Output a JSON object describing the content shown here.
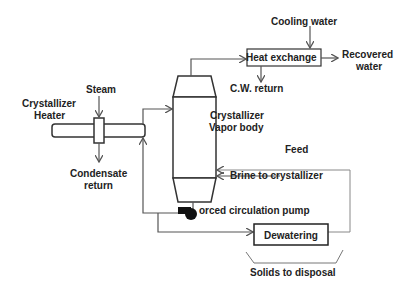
{
  "diagram": {
    "type": "process-flow",
    "labels": {
      "cooling_water": "Cooling water",
      "heat_exchange": "Heat exchange",
      "recovered_water_1": "Recovered",
      "recovered_water_2": "water",
      "cw_return": "C.W. return",
      "steam": "Steam",
      "crystallizer_heater_1": "Crystallizer",
      "crystallizer_heater_2": "Heater",
      "vapor_body_1": "Crystallizer",
      "vapor_body_2": "Vapor body",
      "feed": "Feed",
      "condensate_1": "Condensate",
      "condensate_2": "return",
      "brine": "Brine to crystallizer",
      "pump": "orced circulation pump",
      "dewatering": "Dewatering",
      "solids": "Solids to disposal"
    },
    "colors": {
      "line": "#555555",
      "stroke": "#333333",
      "light_line": "#888888",
      "pump_fill": "#111111"
    }
  }
}
